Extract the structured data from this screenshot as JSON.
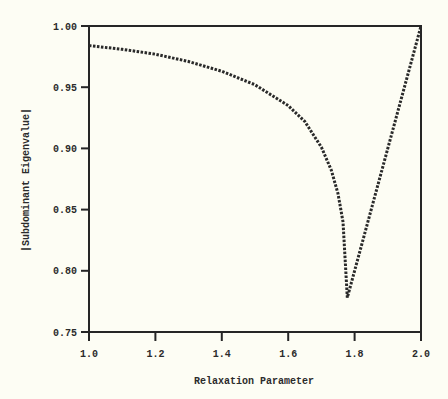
{
  "chart_data": {
    "type": "line",
    "title": "",
    "xlabel": "Relaxation Parameter",
    "ylabel": "|Subdominant Eigenvalue|",
    "xlim": [
      1.0,
      2.0
    ],
    "ylim": [
      0.75,
      1.0
    ],
    "grid": false,
    "legend": null,
    "x_ticks": [
      "1.0",
      "1.2",
      "1.4",
      "1.6",
      "1.8",
      "2.0"
    ],
    "y_ticks": [
      "0.75",
      "0.80",
      "0.85",
      "0.90",
      "0.95",
      "1.00"
    ],
    "line_style": "dotted",
    "series": [
      {
        "name": "spectral radius",
        "x": [
          1.0,
          1.1,
          1.2,
          1.3,
          1.4,
          1.5,
          1.6,
          1.65,
          1.7,
          1.73,
          1.75,
          1.765,
          1.778,
          1.8,
          1.9,
          2.0
        ],
        "y": [
          0.984,
          0.981,
          0.977,
          0.971,
          0.963,
          0.952,
          0.935,
          0.922,
          0.901,
          0.882,
          0.863,
          0.84,
          0.778,
          0.8,
          0.9,
          1.0
        ]
      }
    ]
  },
  "colors": {
    "background": "#fdfdf4",
    "axis": "#262626",
    "line": "#2a2a2a",
    "text": "#2b2b2b"
  }
}
